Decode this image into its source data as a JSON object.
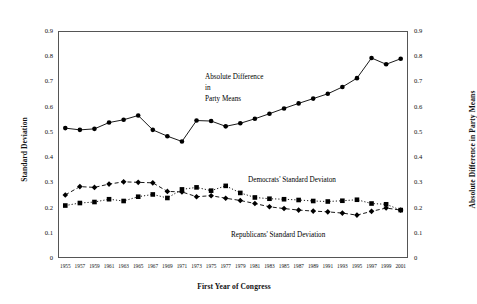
{
  "chart_data": {
    "type": "line",
    "title": "",
    "xlabel": "First Year of Congress",
    "ylabel": "Standard Deviation",
    "ylabel_right": "Absolute Difference in Party Means",
    "ylim": [
      0,
      0.9
    ],
    "ylim_right": [
      0,
      0.9
    ],
    "grid": false,
    "legend_position": "inline-annotations",
    "categories": [
      "1955",
      "1957",
      "1959",
      "1961",
      "1963",
      "1965",
      "1967",
      "1969",
      "1971",
      "1973",
      "1975",
      "1977",
      "1979",
      "1981",
      "1983",
      "1985",
      "1987",
      "1989",
      "1991",
      "1993",
      "1995",
      "1997",
      "1999",
      "2001"
    ],
    "yticks": [
      "0",
      "0.1",
      "0.2",
      "0.3",
      "0.4",
      "0.5",
      "0.6",
      "0.7",
      "0.8",
      "0.9"
    ],
    "yticks_right": [
      "0",
      "0.1",
      "0.2",
      "0.3",
      "0.4",
      "0.5",
      "0.6",
      "0.7",
      "0.8",
      "0.9"
    ],
    "series": [
      {
        "name": "Absolute Difference in Party Means",
        "axis": "right",
        "marker": "circle",
        "line_style": "solid",
        "values": [
          0.515,
          0.508,
          0.512,
          0.537,
          0.548,
          0.565,
          0.508,
          0.483,
          0.462,
          0.545,
          0.543,
          0.522,
          0.534,
          0.552,
          0.572,
          0.593,
          0.613,
          0.632,
          0.651,
          0.678,
          0.713,
          0.793,
          0.768,
          0.79
        ]
      },
      {
        "name": "Democrats' Standard Deviaton",
        "axis": "left",
        "marker": "square",
        "line_style": "dash-dot",
        "values": [
          0.208,
          0.218,
          0.222,
          0.233,
          0.226,
          0.243,
          0.252,
          0.238,
          0.272,
          0.28,
          0.267,
          0.286,
          0.258,
          0.24,
          0.235,
          0.233,
          0.23,
          0.226,
          0.224,
          0.227,
          0.231,
          0.216,
          0.213,
          0.19
        ]
      },
      {
        "name": "Republicans' Standard Deviation",
        "axis": "left",
        "marker": "diamond",
        "line_style": "dashed",
        "values": [
          0.25,
          0.283,
          0.28,
          0.293,
          0.302,
          0.3,
          0.298,
          0.264,
          0.262,
          0.243,
          0.247,
          0.237,
          0.228,
          0.216,
          0.203,
          0.196,
          0.19,
          0.186,
          0.183,
          0.178,
          0.17,
          0.185,
          0.198,
          0.19
        ]
      }
    ],
    "annotations": [
      {
        "name": "absolute-difference-label",
        "lines": [
          "Absolute Difference",
          "in",
          "Party Means"
        ]
      },
      {
        "name": "democrats-label",
        "text": "Democrats' Standard Deviaton"
      },
      {
        "name": "republicans-label",
        "text": "Republicans' Standard Deviation"
      }
    ]
  },
  "colors": {
    "line": "#000000",
    "frame": "#555555",
    "background": "#ffffff"
  }
}
